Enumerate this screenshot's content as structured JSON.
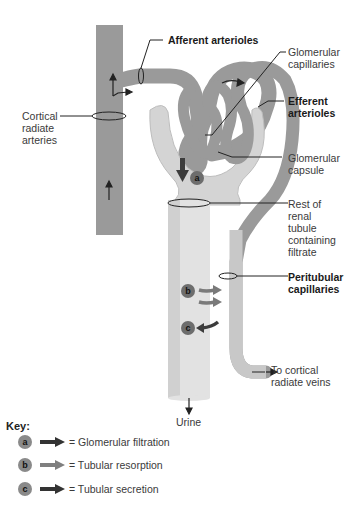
{
  "diagram": {
    "labels": {
      "afferent_arterioles": "Afferent arterioles",
      "glomerular_capillaries_1": "Glomerular",
      "glomerular_capillaries_2": "capillaries",
      "efferent_arterioles_1": "Efferent",
      "efferent_arterioles_2": "arterioles",
      "cortical_radiate_arteries_1": "Cortical",
      "cortical_radiate_arteries_2": "radiate",
      "cortical_radiate_arteries_3": "arteries",
      "glomerular_capsule_1": "Glomerular",
      "glomerular_capsule_2": "capsule",
      "rest_of_tubule_1": "Rest of",
      "rest_of_tubule_2": "renal",
      "rest_of_tubule_3": "tubule",
      "rest_of_tubule_4": "containing",
      "rest_of_tubule_5": "filtrate",
      "peritubular_1": "Peritubular",
      "peritubular_2": "capillaries",
      "to_veins_1": "To cortical",
      "to_veins_2": "radiate veins",
      "urine": "Urine"
    },
    "markers": {
      "a": "a",
      "b": "b",
      "c": "c"
    },
    "colors": {
      "artery": "#9a9a9a",
      "tubule": "#d4d4d4",
      "tubule_light": "#e6e6e6",
      "arrow_dark": "#3c3c3c",
      "arrow_light": "#7a7a7a",
      "badge": "#6d6d6d"
    }
  },
  "key": {
    "title": "Key:",
    "items": [
      {
        "marker": "a",
        "text": "= Glomerular filtration",
        "arrow_color": "#333333"
      },
      {
        "marker": "b",
        "text": "= Tubular resorption",
        "arrow_color": "#7f7f7f"
      },
      {
        "marker": "c",
        "text": "= Tubular secretion",
        "arrow_color": "#333333"
      }
    ]
  }
}
